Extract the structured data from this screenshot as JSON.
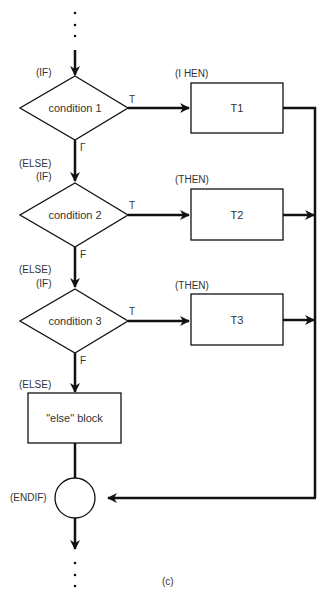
{
  "diagram": {
    "caption": "(c)",
    "colors": {
      "stroke": "#111111",
      "text": "#333333",
      "background": "#ffffff"
    },
    "decisions": [
      {
        "label": "condition 1",
        "keyword": "(IF)",
        "true_label": "T",
        "false_label": "Γ"
      },
      {
        "label": "condition 2",
        "keyword": "(IF)",
        "pre_keyword": "(ELSE)",
        "true_label": "T",
        "false_label": "F"
      },
      {
        "label": "condition 3",
        "keyword": "(IF)",
        "pre_keyword": "(ELSE)",
        "true_label": "T",
        "false_label": "F"
      }
    ],
    "then_blocks": [
      {
        "label": "T1",
        "keyword": "(I HEN)"
      },
      {
        "label": "T2",
        "keyword": "(THEN)"
      },
      {
        "label": "T3",
        "keyword": "(THEN)"
      }
    ],
    "else_block": {
      "label": "\"else\" block",
      "keyword": "(ELSE)"
    },
    "endif": {
      "keyword": "(ENDIF)"
    }
  }
}
